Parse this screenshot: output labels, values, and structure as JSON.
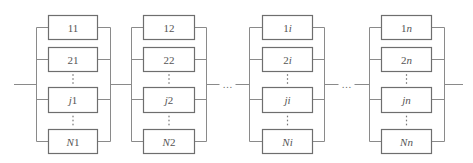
{
  "diagram": {
    "type": "series-parallel reliability block diagram",
    "line_color": "#8a8a8a",
    "box_border_color": "#6e6e6e",
    "text_color": "#555555",
    "main_line_y": 84,
    "series_ellipsis": "…",
    "parallel_ellipsis": "⋮",
    "groups": [
      {
        "id": "group-1",
        "rail_left_x": 36,
        "rail_right_x": 110,
        "box_x": 48,
        "box_w": 49,
        "blocks": [
          {
            "prefix": "1",
            "suffix": "1"
          },
          {
            "prefix": "2",
            "suffix": "1"
          },
          {
            "prefix": "j",
            "suffix": "1"
          },
          {
            "prefix": "N",
            "suffix": "1"
          }
        ]
      },
      {
        "id": "group-2",
        "rail_left_x": 131,
        "rail_right_x": 206,
        "box_x": 143,
        "box_w": 51,
        "blocks": [
          {
            "prefix": "1",
            "suffix": "2"
          },
          {
            "prefix": "2",
            "suffix": "2"
          },
          {
            "prefix": "j",
            "suffix": "2"
          },
          {
            "prefix": "N",
            "suffix": "2"
          }
        ]
      },
      {
        "id": "group-i",
        "rail_left_x": 249,
        "rail_right_x": 324,
        "box_x": 262,
        "box_w": 50,
        "blocks": [
          {
            "prefix": "1",
            "suffix": "i"
          },
          {
            "prefix": "2",
            "suffix": "i"
          },
          {
            "prefix": "j",
            "suffix": "i"
          },
          {
            "prefix": "N",
            "suffix": "i"
          }
        ]
      },
      {
        "id": "group-n",
        "rail_left_x": 369,
        "rail_right_x": 444,
        "box_x": 381,
        "box_w": 50,
        "blocks": [
          {
            "prefix": "1",
            "suffix": "n"
          },
          {
            "prefix": "2",
            "suffix": "n"
          },
          {
            "prefix": "j",
            "suffix": "n"
          },
          {
            "prefix": "N",
            "suffix": "n"
          }
        ]
      }
    ],
    "block_rows": [
      {
        "top": 15,
        "height": 24,
        "mid": 27
      },
      {
        "top": 47,
        "height": 24,
        "mid": 59
      },
      {
        "top": 87,
        "height": 25,
        "mid": 99
      },
      {
        "top": 129,
        "height": 24,
        "mid": 141
      }
    ],
    "labels": {
      "g1": [
        "11",
        "21",
        "j1",
        "N1"
      ],
      "g2": [
        "12",
        "22",
        "j2",
        "N2"
      ],
      "g3": [
        "1i",
        "2i",
        "ji",
        "Ni"
      ],
      "g4": [
        "1n",
        "2n",
        "jn",
        "Nn"
      ]
    },
    "series_gaps": [
      {
        "from_x": 206,
        "to_x": 249,
        "ellipsis": "…"
      },
      {
        "from_x": 324,
        "to_x": 369,
        "ellipsis": "…"
      }
    ],
    "input_line": {
      "from_x": 14,
      "to_x": 36
    },
    "output_line": {
      "from_x": 444,
      "to_x": 463
    }
  }
}
